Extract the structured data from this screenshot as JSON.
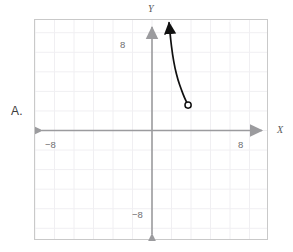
{
  "problem": {
    "choice_label": "A."
  },
  "chart_data": {
    "type": "line",
    "title": "",
    "xlabel": "X",
    "ylabel": "Y",
    "xlim": [
      -12,
      12
    ],
    "ylim": [
      -11.3,
      11.3
    ],
    "grid": true,
    "grid_step": 2,
    "grid_color": "#f0eff2",
    "axis_color": "#9b9b9e",
    "curve_color": "#101010",
    "x_ticks": [
      -8,
      8
    ],
    "y_ticks": [
      -8,
      8
    ],
    "x_tick_labels": [
      "−8",
      "8"
    ],
    "y_tick_labels": [
      "−8",
      "8"
    ],
    "axis_arrows": [
      "left",
      "right",
      "up",
      "down"
    ],
    "series": [
      {
        "name": "branch",
        "style": "solid",
        "start_marker": "arrow-up",
        "end_marker": "open-circle",
        "open_endpoint": [
          3.7,
          2.6
        ],
        "arrow_endpoint": [
          1.75,
          11.0
        ],
        "points": [
          [
            1.75,
            11.0
          ],
          [
            1.9,
            9.4
          ],
          [
            2.1,
            7.8
          ],
          [
            2.35,
            6.4
          ],
          [
            2.65,
            5.2
          ],
          [
            3.0,
            4.2
          ],
          [
            3.35,
            3.3
          ],
          [
            3.7,
            2.6
          ]
        ]
      }
    ]
  }
}
